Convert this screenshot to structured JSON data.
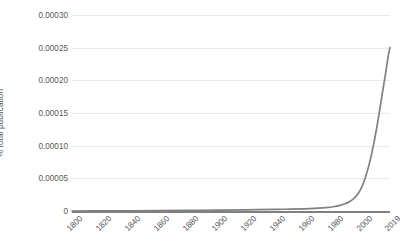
{
  "chart_data": {
    "type": "line",
    "title": "",
    "xlabel": "",
    "ylabel": "% total publication",
    "xlim": [
      1800,
      2019
    ],
    "ylim": [
      0,
      0.0003
    ],
    "grid": true,
    "legend": "none",
    "line_color": "#808080",
    "gridline_color": "#E9E9E9",
    "text_color": "#595959",
    "background_color": "#FFFFFF",
    "x_tick_labels": [
      "1800",
      "1820",
      "1840",
      "1860",
      "1880",
      "1900",
      "1920",
      "1940",
      "1960",
      "1980",
      "2000",
      "2019"
    ],
    "x_tick_values": [
      1800,
      1820,
      1840,
      1860,
      1880,
      1900,
      1920,
      1940,
      1960,
      1980,
      2000,
      2019
    ],
    "y_tick_labels": [
      "0",
      "0.00005",
      "0.00010",
      "0.00015",
      "0.00020",
      "0.00025",
      "0.00030"
    ],
    "y_tick_values": [
      0,
      5e-05,
      0.0001,
      0.00015,
      0.0002,
      0.00025,
      0.0003
    ],
    "series": [
      {
        "name": "% total publication",
        "x": [
          1800,
          1820,
          1840,
          1860,
          1880,
          1900,
          1920,
          1940,
          1950,
          1960,
          1970,
          1975,
          1980,
          1984,
          1988,
          1991,
          1994,
          1996,
          1998,
          2000,
          2002,
          2004,
          2006,
          2008,
          2010,
          2012,
          2014,
          2016,
          2018,
          2019
        ],
        "values": [
          0.0,
          2e-07,
          4e-07,
          6e-07,
          9e-07,
          1.3e-06,
          1.8e-06,
          2.4e-06,
          2.8e-06,
          3.4e-06,
          4.4e-06,
          5.2e-06,
          6.5e-06,
          8.2e-06,
          1.1e-05,
          1.42e-05,
          1.9e-05,
          2.35e-05,
          3e-05,
          3.9e-05,
          5.1e-05,
          6.6e-05,
          8.4e-05,
          0.000105,
          0.000129,
          0.000156,
          0.000184,
          0.000211,
          0.00024,
          0.00025
        ]
      }
    ]
  }
}
